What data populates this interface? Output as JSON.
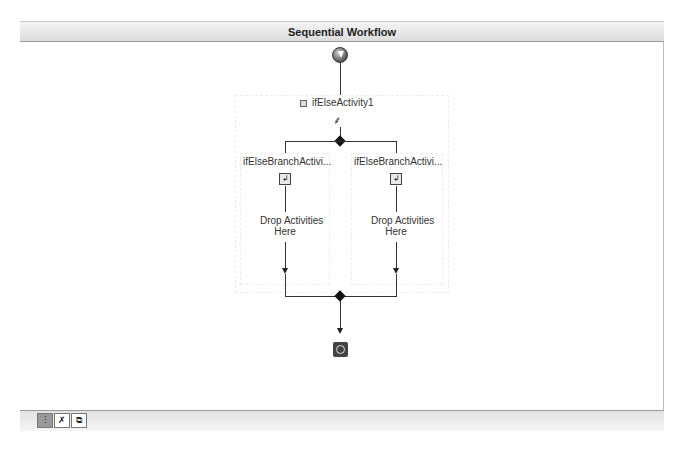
{
  "header": {
    "title": "Sequential Workflow"
  },
  "ifelse": {
    "name": "ifElseActivity1",
    "branches": [
      {
        "name": "ifElseBranchActivi...",
        "placeholder_line1": "Drop Activities",
        "placeholder_line2": "Here"
      },
      {
        "name": "ifElseBranchActivi...",
        "placeholder_line1": "Drop Activities",
        "placeholder_line2": "Here"
      }
    ]
  },
  "footer": {
    "view_tabs": [
      {
        "name": "workflow-view",
        "glyph": "⋮",
        "active": true
      },
      {
        "name": "cancel-handler-view",
        "glyph": "✗",
        "active": false
      },
      {
        "name": "fault-handlers-view",
        "glyph": "⧉",
        "active": false
      }
    ]
  }
}
